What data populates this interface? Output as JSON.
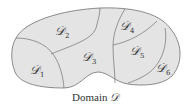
{
  "figure": {
    "caption_text": "Domain",
    "caption_symbol": "𝒟",
    "fill_color": "#e4e4e4",
    "stroke_color": "#707070",
    "text_color": "#333333",
    "regions": [
      {
        "id": "D1",
        "symbol": "𝒟",
        "subscript": "1"
      },
      {
        "id": "D2",
        "symbol": "𝒟",
        "subscript": "2"
      },
      {
        "id": "D3",
        "symbol": "𝒟",
        "subscript": "3"
      },
      {
        "id": "D4",
        "symbol": "𝒟",
        "subscript": "4"
      },
      {
        "id": "D5",
        "symbol": "𝒟",
        "subscript": "5"
      },
      {
        "id": "D6",
        "symbol": "𝒟",
        "subscript": "6"
      }
    ]
  }
}
